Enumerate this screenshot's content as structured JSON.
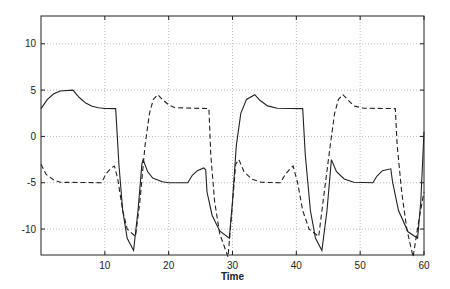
{
  "chart_data": {
    "type": "line",
    "title": "",
    "xlabel": "Time",
    "ylabel": "",
    "xlim": [
      0,
      60
    ],
    "ylim": [
      -12.8,
      13
    ],
    "grid": true,
    "legend": null,
    "xticks": [
      10,
      20,
      30,
      40,
      50,
      60
    ],
    "yticks": [
      -10,
      -5,
      0,
      5,
      10
    ],
    "series": [
      {
        "name": "solid",
        "style": "solid",
        "points": [
          [
            0,
            3
          ],
          [
            1,
            4
          ],
          [
            2,
            4.6
          ],
          [
            3,
            4.9
          ],
          [
            5,
            5
          ],
          [
            6,
            4.2
          ],
          [
            7,
            3.6
          ],
          [
            8,
            3.25
          ],
          [
            9,
            3.1
          ],
          [
            10,
            3.02
          ],
          [
            11.7,
            3
          ],
          [
            12.2,
            -3
          ],
          [
            12.8,
            -8
          ],
          [
            13.5,
            -11
          ],
          [
            14.5,
            -12.3
          ],
          [
            15.2,
            -8
          ],
          [
            15.8,
            -3
          ],
          [
            16,
            -2.5
          ],
          [
            16.7,
            -3.8
          ],
          [
            17.5,
            -4.5
          ],
          [
            19,
            -4.9
          ],
          [
            20,
            -5
          ],
          [
            23,
            -5
          ],
          [
            23.7,
            -4.2
          ],
          [
            24.5,
            -3.7
          ],
          [
            25.5,
            -3.4
          ],
          [
            25.8,
            -3.6
          ],
          [
            26,
            -6
          ],
          [
            26.8,
            -8.5
          ],
          [
            28,
            -10.2
          ],
          [
            29.5,
            -11
          ],
          [
            30,
            -7
          ],
          [
            30.6,
            -1
          ],
          [
            31.3,
            2.5
          ],
          [
            32.2,
            4
          ],
          [
            33.5,
            4.5
          ],
          [
            34.3,
            3.9
          ],
          [
            35.5,
            3.3
          ],
          [
            37,
            3.05
          ],
          [
            41,
            3
          ],
          [
            41.4,
            -2
          ],
          [
            42.2,
            -8
          ],
          [
            43,
            -11
          ],
          [
            44,
            -12.3
          ],
          [
            44.8,
            -8
          ],
          [
            45.5,
            -2.5
          ],
          [
            46.3,
            -3.8
          ],
          [
            47.5,
            -4.6
          ],
          [
            49,
            -4.95
          ],
          [
            52,
            -5
          ],
          [
            52.6,
            -4.3
          ],
          [
            53.5,
            -3.7
          ],
          [
            54.8,
            -3.5
          ],
          [
            55.1,
            -5
          ],
          [
            56,
            -8
          ],
          [
            57.5,
            -10.3
          ],
          [
            59,
            -11
          ],
          [
            59.5,
            -7
          ],
          [
            60,
            0.5
          ]
        ]
      },
      {
        "name": "dashed",
        "style": "dashed",
        "points": [
          [
            0,
            -3
          ],
          [
            0.8,
            -4.1
          ],
          [
            2,
            -4.7
          ],
          [
            3,
            -4.95
          ],
          [
            9.5,
            -5
          ],
          [
            10.2,
            -4
          ],
          [
            11,
            -3.4
          ],
          [
            11.5,
            -3.2
          ],
          [
            12,
            -4.5
          ],
          [
            12.8,
            -8
          ],
          [
            13.5,
            -10
          ],
          [
            14.8,
            -10.8
          ],
          [
            15.5,
            -7
          ],
          [
            16.3,
            -1
          ],
          [
            17,
            2.5
          ],
          [
            17.6,
            4
          ],
          [
            18.3,
            4.5
          ],
          [
            19,
            4
          ],
          [
            20,
            3.4
          ],
          [
            21,
            3.1
          ],
          [
            26.3,
            3
          ],
          [
            26.6,
            -2
          ],
          [
            27.2,
            -7
          ],
          [
            28,
            -10.5
          ],
          [
            29.3,
            -13
          ],
          [
            29.8,
            -9
          ],
          [
            30.5,
            -3
          ],
          [
            31,
            -2.5
          ],
          [
            31.8,
            -3.8
          ],
          [
            33,
            -4.6
          ],
          [
            34.5,
            -4.95
          ],
          [
            37.5,
            -5
          ],
          [
            38.2,
            -4.2
          ],
          [
            39,
            -3.5
          ],
          [
            39.5,
            -3.2
          ],
          [
            40.2,
            -5
          ],
          [
            41,
            -8
          ],
          [
            42,
            -10
          ],
          [
            43.5,
            -10.8
          ],
          [
            44.2,
            -7
          ],
          [
            45.3,
            -1
          ],
          [
            46,
            2.5
          ],
          [
            46.6,
            4
          ],
          [
            47.3,
            4.5
          ],
          [
            48,
            4
          ],
          [
            49,
            3.3
          ],
          [
            50.5,
            3.05
          ],
          [
            55.5,
            3
          ],
          [
            55.8,
            -1
          ],
          [
            56.5,
            -6
          ],
          [
            57.3,
            -10
          ],
          [
            58.3,
            -13
          ],
          [
            59.2,
            -9
          ],
          [
            60,
            -6
          ]
        ]
      }
    ]
  },
  "plot": {
    "x_px": [
      41,
      424
    ],
    "y_px": [
      16,
      255
    ]
  }
}
